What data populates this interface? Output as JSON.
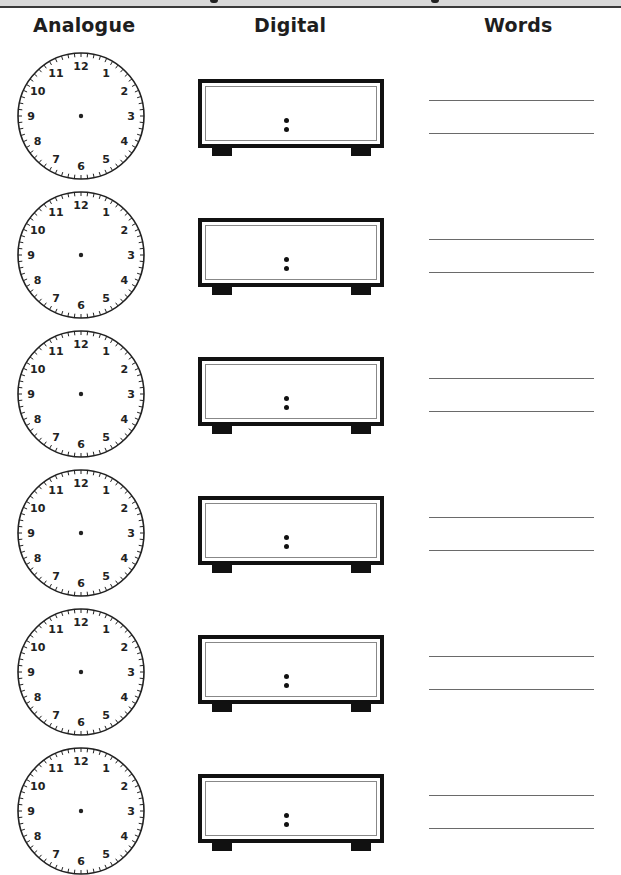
{
  "page": {
    "banner": {
      "background": "#d9d9d9",
      "rule_color": "#3a3a3a"
    },
    "columns": {
      "analogue": "Analogue",
      "digital": "Digital",
      "words": "Words"
    },
    "clock_face": {
      "numerals": [
        "12",
        "1",
        "2",
        "3",
        "4",
        "5",
        "6",
        "7",
        "8",
        "9",
        "10",
        "11"
      ],
      "minute_ticks": 60
    },
    "digital_display": {
      "separator": ":"
    },
    "rows": [
      {
        "index": 1,
        "analogue_time": "",
        "digital_time": "",
        "words_line_1": "",
        "words_line_2": ""
      },
      {
        "index": 2,
        "analogue_time": "",
        "digital_time": "",
        "words_line_1": "",
        "words_line_2": ""
      },
      {
        "index": 3,
        "analogue_time": "",
        "digital_time": "",
        "words_line_1": "",
        "words_line_2": ""
      },
      {
        "index": 4,
        "analogue_time": "",
        "digital_time": "",
        "words_line_1": "",
        "words_line_2": ""
      },
      {
        "index": 5,
        "analogue_time": "",
        "digital_time": "",
        "words_line_1": "",
        "words_line_2": ""
      },
      {
        "index": 6,
        "analogue_time": "",
        "digital_time": "",
        "words_line_1": "",
        "words_line_2": ""
      }
    ]
  }
}
